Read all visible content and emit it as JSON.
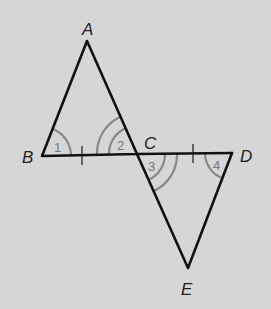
{
  "diagram": {
    "type": "geometry",
    "colors": {
      "background": "#d6d6d6",
      "lines": "#111111",
      "arcs": "#888888"
    },
    "vertices": {
      "A": {
        "label": "A",
        "x": 87,
        "y": 41
      },
      "B": {
        "label": "B",
        "x": 42,
        "y": 156
      },
      "C": {
        "label": "C",
        "x": 137,
        "y": 154
      },
      "D": {
        "label": "D",
        "x": 232,
        "y": 153
      },
      "E": {
        "label": "E",
        "x": 188,
        "y": 268
      }
    },
    "segments": [
      "AB",
      "AC",
      "BD",
      "CE",
      "DE"
    ],
    "angles": [
      {
        "label": "1",
        "vertex": "B",
        "arcs": 1
      },
      {
        "label": "2",
        "vertex": "C",
        "arcs": 2,
        "between": "CA and CB"
      },
      {
        "label": "3",
        "vertex": "C",
        "arcs": 2,
        "between": "CD and CE"
      },
      {
        "label": "4",
        "vertex": "D",
        "arcs": 1
      }
    ],
    "tick_marks": [
      {
        "segment": "BC",
        "count": 1
      },
      {
        "segment": "CD",
        "count": 1
      }
    ]
  }
}
